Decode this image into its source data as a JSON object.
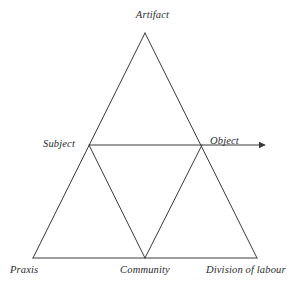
{
  "diagram": {
    "type": "activity-theory-triangle",
    "background_color": "#ffffff",
    "line_color": "#3a3a3a",
    "text_color": "#2b2b2b",
    "nodes": [
      {
        "id": "artifact",
        "label": "Artifact",
        "position": "top-apex"
      },
      {
        "id": "subject",
        "label": "Subject",
        "position": "middle-left"
      },
      {
        "id": "object",
        "label": "Object",
        "position": "middle-right"
      },
      {
        "id": "praxis",
        "label": "Praxis",
        "position": "bottom-left"
      },
      {
        "id": "community",
        "label": "Community",
        "position": "bottom-center"
      },
      {
        "id": "division",
        "label": "Division of labour",
        "position": "bottom-right"
      }
    ],
    "edges": [
      {
        "from": "artifact",
        "to": "praxis",
        "style": "solid"
      },
      {
        "from": "artifact",
        "to": "division",
        "style": "solid"
      },
      {
        "from": "praxis",
        "to": "division",
        "style": "solid"
      },
      {
        "from": "subject",
        "to": "object",
        "style": "solid-arrow",
        "arrowhead": "right"
      },
      {
        "from": "subject",
        "to": "community",
        "style": "solid"
      },
      {
        "from": "object",
        "to": "community",
        "style": "solid"
      }
    ]
  }
}
